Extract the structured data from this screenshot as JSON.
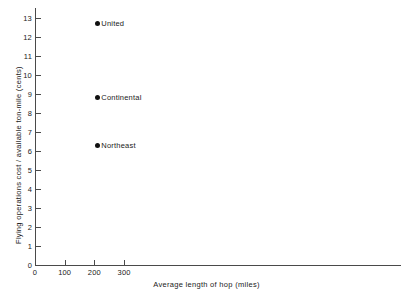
{
  "chart_data": {
    "type": "scatter",
    "title": "",
    "xlabel": "Average length of hop (miles)",
    "ylabel": "Flying operations cost / available ton-mile (cents)",
    "xlim": [
      0,
      1230
    ],
    "ylim": [
      0,
      13.6
    ],
    "grid": false,
    "legend": "none",
    "x_ticks": [
      0,
      100,
      200,
      300
    ],
    "x_tick_labels": [
      "0",
      "100",
      "200",
      "300"
    ],
    "y_ticks": [
      0,
      1,
      2,
      3,
      4,
      5,
      6,
      7,
      8,
      9,
      10,
      11,
      12,
      13
    ],
    "y_tick_labels": [
      "0",
      "1",
      "2",
      "3",
      "4",
      "5",
      "6",
      "7",
      "8",
      "9",
      "10",
      "11",
      "12",
      "13"
    ],
    "points": [
      {
        "label": "United",
        "x": 210,
        "y": 12.7
      },
      {
        "label": "Continental",
        "x": 210,
        "y": 8.8
      },
      {
        "label": "Northeast",
        "x": 210,
        "y": 6.3
      }
    ],
    "marker_color": "#111111",
    "axis_color": "#4a4a4a"
  }
}
